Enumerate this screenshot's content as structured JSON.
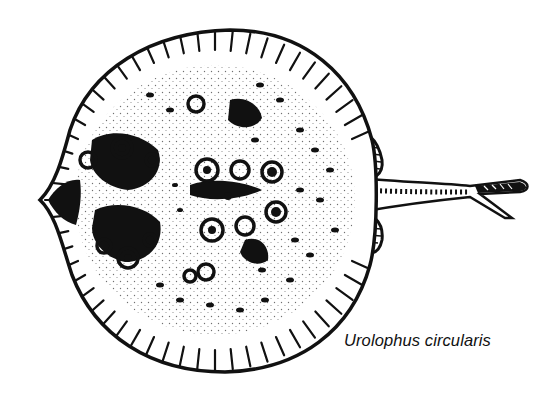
{
  "figure": {
    "caption": "Urolophus circularis",
    "style": "black-and-white stipple line drawing",
    "colors": {
      "ink": "#111111",
      "paper": "#ffffff"
    }
  }
}
